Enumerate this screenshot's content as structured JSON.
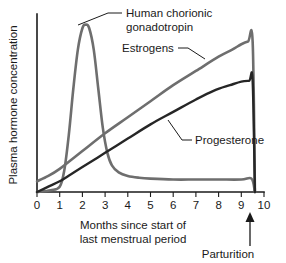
{
  "chart_data": {
    "type": "line",
    "title": "",
    "xlabel": "Months since start of last menstrual period",
    "xlabel_line1": "Months since start of",
    "xlabel_line2": "last menstrual period",
    "ylabel": "Plasma hormone concentration",
    "xlim": [
      0,
      10
    ],
    "ylim": [
      0,
      100
    ],
    "xticks": [
      0,
      1,
      2,
      3,
      4,
      5,
      6,
      7,
      8,
      9,
      10
    ],
    "xticklabels": [
      "0",
      "1",
      "2",
      "3",
      "4",
      "5",
      "6",
      "7",
      "8",
      "9",
      "10"
    ],
    "yticks": [],
    "yticklabels": [],
    "grid": false,
    "legend": "inline-labels",
    "series": [
      {
        "name": "Human chorionic gonadotropin",
        "color": "#6e6e6e",
        "linewidth": 2.6,
        "x": [
          0.0,
          0.6,
          1.0,
          1.2,
          1.4,
          1.6,
          1.8,
          2.0,
          2.15,
          2.3,
          2.5,
          2.7,
          2.9,
          3.1,
          3.3,
          3.6,
          4.0,
          4.5,
          5.0,
          6.0,
          7.0,
          8.0,
          9.0,
          9.45,
          9.6
        ],
        "y": [
          0,
          1,
          3,
          12,
          32,
          58,
          80,
          92,
          94,
          92,
          80,
          58,
          36,
          22,
          15,
          11,
          9,
          8,
          7.5,
          7,
          7,
          7,
          7,
          7.5,
          0
        ]
      },
      {
        "name": "Estrogens",
        "color": "#6e6e6e",
        "linewidth": 2.6,
        "x": [
          0.0,
          0.5,
          1.0,
          1.5,
          2.0,
          3.0,
          4.0,
          5.0,
          6.0,
          7.0,
          8.0,
          8.6,
          9.0,
          9.3,
          9.5,
          9.6
        ],
        "y": [
          6,
          9,
          13,
          18,
          23,
          33,
          42,
          51,
          60,
          68,
          76,
          80,
          83,
          84.5,
          84.5,
          0
        ]
      },
      {
        "name": "Progesterone",
        "color": "#262626",
        "linewidth": 2.4,
        "x": [
          0.0,
          0.5,
          1.0,
          1.5,
          2.0,
          3.0,
          4.0,
          5.0,
          6.0,
          7.0,
          7.8,
          8.5,
          9.0,
          9.35,
          9.5,
          9.6
        ],
        "y": [
          0,
          3,
          6,
          10,
          14,
          22,
          30,
          38,
          45,
          52,
          57,
          60,
          62,
          62.5,
          62.5,
          0
        ]
      }
    ],
    "annotations": [
      {
        "name": "hcg-label",
        "text_line1": "Human chorionic",
        "text_line2": "gonadotropin",
        "text": "Human chorionic gonadotropin"
      },
      {
        "name": "estrogens-label",
        "text": "Estrogens"
      },
      {
        "name": "progesterone-label",
        "text": "Progesterone"
      },
      {
        "name": "parturition-label",
        "text": "Parturition",
        "marker": "up-arrow",
        "x": 9.55
      }
    ]
  },
  "figure": {
    "background": "#ffffff",
    "axis_color": "#1a1a1a"
  }
}
